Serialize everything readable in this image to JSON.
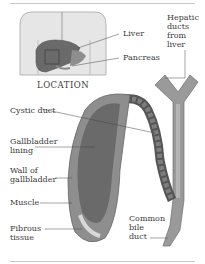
{
  "diagram": {
    "inset_caption": "LOCATION",
    "labels": {
      "liver": "Liver",
      "pancreas": "Pancreas",
      "hepatic_ducts": "Hepatic\nducts\nfrom\nliver",
      "cystic_duct": "Cystic duct",
      "gallbladder_lining": "Gallbladder\nlining",
      "wall_of_gallbladder": "Wall of\ngallbladder",
      "muscle": "Muscle",
      "fibrous_tissue": "Fibrous\ntissue",
      "common_bile_duct": "Common\nbile\nduct"
    },
    "colors": {
      "body_outline": "#b5b5b5",
      "body_fill": "#e6e6e6",
      "organ_dark": "#6a6a6a",
      "organ_mid": "#8e8e8e",
      "organ_light": "#b8b8b8",
      "rule": "#c8c8c8"
    }
  }
}
